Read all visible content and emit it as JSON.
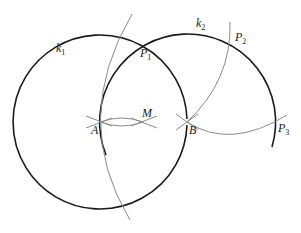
{
  "diagram": {
    "type": "geometric-construction",
    "circles": [
      {
        "name": "k1",
        "label": "k",
        "sub": "1",
        "center": [
          100,
          122
        ],
        "radius": 87
      },
      {
        "name": "k2",
        "label": "k",
        "sub": "2",
        "center": [
          187,
          122
        ],
        "radius": 88
      }
    ],
    "points": [
      {
        "name": "A",
        "label": "A",
        "sub": "",
        "x": 100,
        "y": 122
      },
      {
        "name": "M",
        "label": "M",
        "sub": "",
        "x": 143,
        "y": 122
      },
      {
        "name": "B",
        "label": "B",
        "sub": "",
        "x": 187,
        "y": 122
      },
      {
        "name": "P1",
        "label": "P",
        "sub": "1",
        "x": 144,
        "y": 43
      },
      {
        "name": "P2",
        "label": "P",
        "sub": "2",
        "x": 231,
        "y": 43
      },
      {
        "name": "P3",
        "label": "P",
        "sub": "3",
        "x": 275,
        "y": 122
      }
    ],
    "colors": {
      "circle": "#1a1a1a",
      "construction": "#8a8a8a"
    }
  }
}
